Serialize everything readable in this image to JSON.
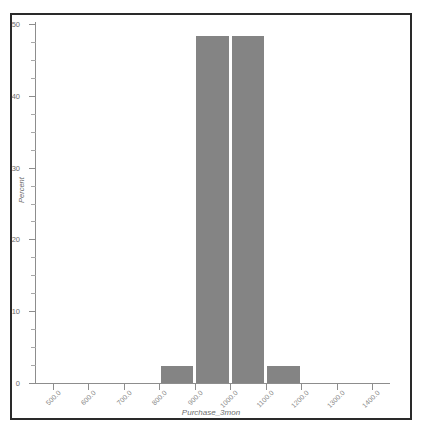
{
  "top_sliver_text": "",
  "chart_data": {
    "type": "bar",
    "title": "",
    "subtitle": "",
    "xlabel": "Purchase_3mon",
    "ylabel": "Percent",
    "xlim": [
      450,
      1450
    ],
    "ylim": [
      0,
      50
    ],
    "grid": false,
    "legend": false,
    "legend_position": "none",
    "bar_color": "#848484",
    "axis_color": "#8d8d8d",
    "frame_color": "#2a2a2a",
    "x_tick_labels": [
      "500.0",
      "600.0",
      "700.0",
      "800.0",
      "900.0",
      "1000.0",
      "1100.0",
      "1200.0",
      "1300.0",
      "1400.0"
    ],
    "x_tick_values": [
      500,
      600,
      700,
      800,
      900,
      1000,
      1100,
      1200,
      1300,
      1400
    ],
    "y_tick_labels": [
      "0",
      "10",
      "20",
      "30",
      "40",
      "50"
    ],
    "y_tick_values": [
      0,
      10,
      20,
      30,
      40,
      50
    ],
    "y_minor_tick_values": [
      2.5,
      5,
      7.5,
      12.5,
      15,
      17.5,
      22.5,
      25,
      27.5,
      32.5,
      35,
      37.5,
      42.5,
      45,
      47.5
    ],
    "bin_width": 100,
    "bins": [
      {
        "left": 800,
        "right": 900,
        "center": 850,
        "label": "800.0",
        "value": 2.4
      },
      {
        "left": 900,
        "right": 1000,
        "center": 950,
        "label": "900.0",
        "value": 48.3
      },
      {
        "left": 1000,
        "right": 1100,
        "center": 1050,
        "label": "1000.0",
        "value": 48.3
      },
      {
        "left": 1100,
        "right": 1200,
        "center": 1150,
        "label": "1100.0",
        "value": 2.4
      }
    ],
    "categories": [
      "800-900",
      "900-1000",
      "1000-1100",
      "1100-1200"
    ],
    "values": [
      2.4,
      48.3,
      48.3,
      2.4
    ]
  }
}
